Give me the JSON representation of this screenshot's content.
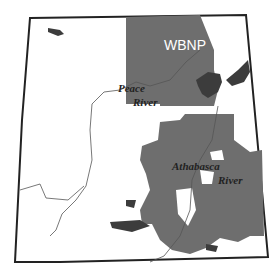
{
  "map": {
    "colors": {
      "background": "#ffffff",
      "province_border": "#222222",
      "protected_area": "#6e6e6e",
      "lake": "#3c3c3c",
      "river": "#555555",
      "park_label": "#ffffff",
      "river_label": "#222222"
    },
    "labels": {
      "park": "WBNP",
      "peace_line1": "Peace",
      "peace_line2": "River",
      "athabasca_line1": "Athabasca",
      "athabasca_line2": "River"
    }
  }
}
